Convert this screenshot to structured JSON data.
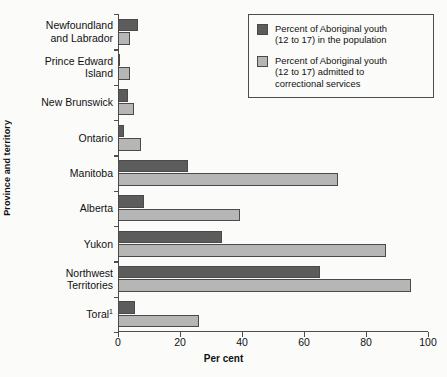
{
  "chart_data": {
    "type": "bar",
    "orientation": "horizontal",
    "title": "",
    "xlabel": "Per cent",
    "ylabel": "Province and territory",
    "xlim": [
      0,
      100
    ],
    "xticks": [
      0,
      20,
      40,
      60,
      80,
      100
    ],
    "grid": false,
    "legend_position": "top-right",
    "categories": [
      "Newfoundland and Labrador",
      "Prince Edward Island",
      "New Brunswick",
      "Ontario",
      "Manitoba",
      "Alberta",
      "Yukon",
      "Northwest Territories",
      "Toral¹"
    ],
    "category_lines": [
      [
        "Newfoundland",
        "and Labrador"
      ],
      [
        "Prince Edward",
        "Island"
      ],
      [
        "New Brunswick"
      ],
      [
        "Ontario"
      ],
      [
        "Manitoba"
      ],
      [
        "Alberta"
      ],
      [
        "Yukon"
      ],
      [
        "Northwest",
        "Territories"
      ],
      [
        "Toral¹"
      ]
    ],
    "series": [
      {
        "name": "Percent of Aboriginal youth (12 to 17) in the population",
        "color": "#5c5c5c",
        "values": [
          6.5,
          0.8,
          3.3,
          1.8,
          22.5,
          8.5,
          33.5,
          65.0,
          5.5
        ]
      },
      {
        "name": "Percent of Aboriginal youth (12 to 17) admitted to correctional services",
        "color": "#b6b6b6",
        "values": [
          3.8,
          4.0,
          5.3,
          7.5,
          71.0,
          39.5,
          86.5,
          94.5,
          26.0
        ]
      }
    ]
  },
  "legend": {
    "items": [
      {
        "swatch": "dark",
        "lines": [
          "Percent of Aboriginal youth",
          "(12 to 17) in the population"
        ]
      },
      {
        "swatch": "light",
        "lines": [
          "Percent of Aboriginal youth",
          "(12 to 17) admitted to",
          "correctional services"
        ]
      }
    ]
  },
  "axes": {
    "x_title": "Per cent",
    "y_title": "Province and territory",
    "x_tick_labels": [
      "0",
      "20",
      "40",
      "60",
      "80",
      "100"
    ]
  }
}
